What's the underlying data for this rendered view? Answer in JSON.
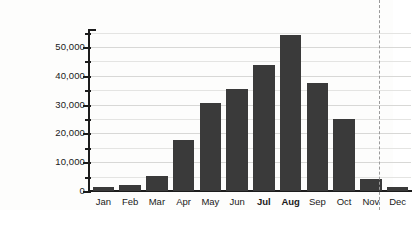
{
  "chart_data": {
    "type": "bar",
    "title": "",
    "subtitle": "",
    "xlabel": "",
    "ylabel": "",
    "categories": [
      "Jan",
      "Feb",
      "Mar",
      "Apr",
      "May",
      "Jun",
      "Jul",
      "Aug",
      "Sep",
      "Oct",
      "Nov",
      "Dec"
    ],
    "values": [
      1300,
      2000,
      5200,
      17700,
      30500,
      35400,
      43700,
      54000,
      37500,
      25000,
      4300,
      1300
    ],
    "emphasized_categories": [
      "Jul",
      "Aug"
    ],
    "ylim": [
      0,
      55900
    ],
    "ytick_labels": [
      "0",
      "10,000",
      "20,000",
      "30,000",
      "40,000",
      "50,000"
    ],
    "ytick_values": [
      0,
      10000,
      20000,
      30000,
      40000,
      50000
    ],
    "yminor_tick_values": [
      5000,
      15000,
      25000,
      35000,
      45000,
      55000
    ],
    "grid": "horizontal",
    "legend": "none",
    "bar_color": "#3a3a3a",
    "axis_color": "#1c1c1c",
    "grid_color": "#d8d8d6",
    "background_color": "#fdfdfc"
  },
  "annotations": {
    "crop_line_name": "page-crop-dashed-line"
  }
}
